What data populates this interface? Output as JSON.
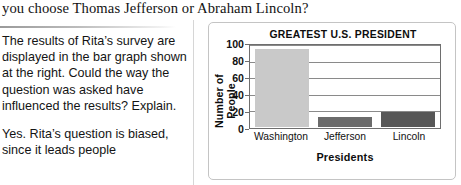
{
  "top_question": "you choose Thomas Jefferson or Abraham Lincoln?",
  "left_column": {
    "paragraph_1": "The results of Rita’s survey are displayed in the bar graph shown at the right. Could the way the question was asked have influenced the results? Explain.",
    "paragraph_2": "Yes. Rita’s question is biased, since it leads people"
  },
  "chart_data": {
    "type": "bar",
    "title": "GREATEST U.S. PRESIDENT",
    "xlabel": "Presidents",
    "ylabel": "Number of People",
    "categories": [
      "Washington",
      "Jefferson",
      "Lincoln"
    ],
    "values": [
      96,
      12,
      18
    ],
    "bar_colors": [
      "#c9c9c9",
      "#6b6b6b",
      "#575757"
    ],
    "ylim": [
      0,
      100
    ],
    "yticks": [
      0,
      20,
      40,
      60,
      80,
      100
    ],
    "grid": "horizontal",
    "legend": "none"
  },
  "colors": {
    "text": "#141414",
    "card_border": "#c4c4c4",
    "axis": "#6e6e6e",
    "gridline": "#8a8a8a",
    "divider": "#d6d6d6"
  }
}
